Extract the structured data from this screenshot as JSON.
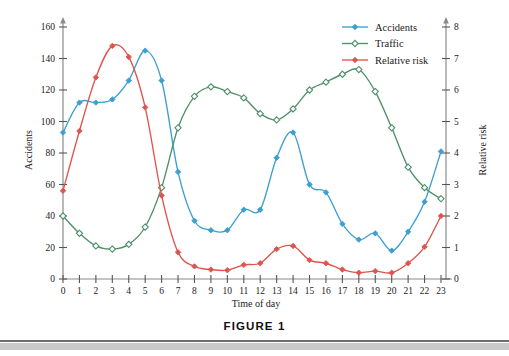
{
  "figure": {
    "caption": "FIGURE  1"
  },
  "chart_data": {
    "type": "line",
    "title": "",
    "subtitle": "",
    "xlabel": "Time of day",
    "ylabel": "Accidents",
    "y2label": "Relative risk",
    "grid": false,
    "legend_position": "top-right",
    "x": [
      0,
      1,
      2,
      3,
      4,
      5,
      6,
      7,
      8,
      9,
      10,
      11,
      12,
      13,
      14,
      15,
      16,
      17,
      18,
      19,
      20,
      21,
      22,
      23
    ],
    "xtick_labels": [
      "0",
      "1",
      "2",
      "3",
      "4",
      "5",
      "6",
      "7",
      "8",
      "9",
      "10",
      "11",
      "12",
      "13",
      "14",
      "15",
      "16",
      "17",
      "18",
      "19",
      "20",
      "21",
      "22",
      "23"
    ],
    "xlim": [
      0,
      23
    ],
    "ylim": [
      0,
      160
    ],
    "ytick_labels": [
      "0",
      "20",
      "40",
      "60",
      "80",
      "100",
      "120",
      "140",
      "160"
    ],
    "yticks": [
      0,
      20,
      40,
      60,
      80,
      100,
      120,
      140,
      160
    ],
    "y2lim": [
      0,
      8
    ],
    "y2tick_labels": [
      "0",
      "1",
      "2",
      "3",
      "4",
      "5",
      "6",
      "7",
      "8"
    ],
    "y2ticks": [
      0,
      1,
      2,
      3,
      4,
      5,
      6,
      7,
      8
    ],
    "series": [
      {
        "name": "Accidents",
        "axis": "left",
        "color": "#3c9fd0",
        "marker": "filled-diamond",
        "values": [
          93,
          112,
          112,
          114,
          126,
          145,
          126,
          68,
          37,
          31,
          31,
          44,
          44,
          77,
          93,
          60,
          55,
          35,
          25,
          29,
          18,
          30,
          49,
          81
        ]
      },
      {
        "name": "Traffic",
        "axis": "left",
        "color": "#4f8f6a",
        "marker": "open-diamond",
        "values": [
          40,
          29,
          21,
          19,
          22,
          33,
          58,
          96,
          116,
          122,
          119,
          115,
          105,
          101,
          108,
          120,
          125,
          130,
          133,
          119,
          96,
          71,
          58,
          51
        ]
      },
      {
        "name": "Relative risk",
        "axis": "right",
        "color": "#e0544e",
        "marker": "filled-diamond",
        "values": [
          2.8,
          4.7,
          6.4,
          7.4,
          7.05,
          5.45,
          2.65,
          0.85,
          0.4,
          0.3,
          0.28,
          0.45,
          0.5,
          0.95,
          1.05,
          0.6,
          0.5,
          0.3,
          0.2,
          0.25,
          0.2,
          0.5,
          1.02,
          2.0
        ]
      }
    ]
  }
}
